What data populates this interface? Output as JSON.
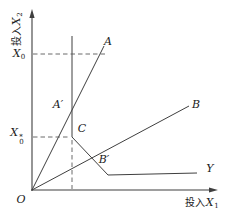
{
  "diagram": {
    "colors": {
      "background": "#ffffff",
      "line": "#3f3f3f",
      "dashed_line": "#5a5a5a",
      "text": "#1a1a1a"
    },
    "axes": {
      "y_label_prefix": "投入",
      "y_label_var": "X",
      "y_label_sub": "2",
      "x_label_prefix": "投入",
      "x_label_var": "X",
      "x_label_sub": "1",
      "origin_label": "O"
    },
    "ticks": {
      "x0_base": "X",
      "x0_sub": "0",
      "x0star_base": "X",
      "x0star_sub": "0",
      "x0star_sup": "*"
    },
    "points": {
      "a": "A",
      "a_prime": "A′",
      "b": "B",
      "b_prime": "B′",
      "c": "C",
      "y_curve": "Y"
    }
  }
}
